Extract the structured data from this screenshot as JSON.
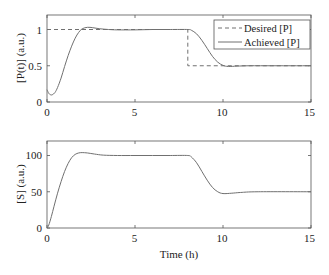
{
  "chart_data": [
    {
      "type": "line",
      "title": "",
      "xlabel": "",
      "ylabel": "[P(t)] (a.u.)",
      "xlim": [
        0,
        15
      ],
      "ylim": [
        0,
        1.2
      ],
      "xticks": [
        0,
        5,
        10,
        15
      ],
      "yticks": [
        0,
        0.5,
        1
      ],
      "ytick_labels": [
        "0",
        "0.5",
        "1"
      ],
      "grid": false,
      "legend_position": "upper right",
      "series": [
        {
          "name": "Desired [P]",
          "style": "dashed",
          "color": "#707070",
          "x": [
            0,
            8,
            8,
            15
          ],
          "y": [
            1,
            1,
            0.5,
            0.5
          ]
        },
        {
          "name": "Achieved [P]",
          "style": "solid",
          "color": "#707070",
          "x": [
            0,
            0.1,
            0.2,
            0.3,
            0.45,
            0.6,
            0.8,
            1.0,
            1.2,
            1.4,
            1.6,
            1.8,
            2.0,
            2.3,
            2.6,
            3.0,
            3.5,
            4.0,
            5.0,
            6.0,
            7.0,
            8.0,
            8.2,
            8.5,
            8.8,
            9.1,
            9.4,
            9.7,
            10.0,
            10.3,
            10.8,
            11.5,
            12.5,
            15.0
          ],
          "y": [
            0.17,
            0.12,
            0.1,
            0.1,
            0.13,
            0.2,
            0.33,
            0.49,
            0.64,
            0.77,
            0.88,
            0.96,
            1.01,
            1.03,
            1.025,
            1.01,
            1.0,
            0.995,
            0.995,
            1.0,
            1.0,
            1.0,
            0.99,
            0.94,
            0.85,
            0.74,
            0.63,
            0.55,
            0.505,
            0.49,
            0.495,
            0.5,
            0.5,
            0.5
          ]
        }
      ],
      "legend": [
        "Desired [P]",
        "Achieved [P]"
      ]
    },
    {
      "type": "line",
      "title": "",
      "xlabel": "Time (h)",
      "ylabel": "[S] (a.u.)",
      "xlim": [
        0,
        15
      ],
      "ylim": [
        0,
        120
      ],
      "xticks": [
        0,
        5,
        10,
        15
      ],
      "yticks": [
        0,
        50,
        100
      ],
      "ytick_labels": [
        "0",
        "50",
        "100"
      ],
      "grid": false,
      "series": [
        {
          "name": "[S]",
          "style": "solid",
          "color": "#707070",
          "x": [
            0,
            0.1,
            0.25,
            0.4,
            0.6,
            0.8,
            1.0,
            1.2,
            1.4,
            1.6,
            1.8,
            2.0,
            2.3,
            2.7,
            3.2,
            4.0,
            5.0,
            6.0,
            7.0,
            8.0,
            8.2,
            8.5,
            8.8,
            9.1,
            9.4,
            9.7,
            10.0,
            10.5,
            11.0,
            12.0,
            15.0
          ],
          "y": [
            0,
            4,
            16,
            30,
            48,
            64,
            78,
            89,
            97,
            101.5,
            103.5,
            104,
            103.5,
            102,
            100.5,
            100,
            100,
            100,
            100,
            100,
            98,
            90,
            78,
            66,
            56,
            50,
            47.5,
            48,
            49,
            50,
            50
          ]
        }
      ]
    }
  ],
  "plots": {
    "top": {
      "ylabel": "[P(t)] (a.u.)",
      "ytick_labels": [
        "0",
        "0.5",
        "1"
      ],
      "xtick_labels": [
        "0",
        "5",
        "10",
        "15"
      ],
      "legend": {
        "desired_label": "Desired [P]",
        "achieved_label": "Achieved [P]"
      }
    },
    "bottom": {
      "ylabel": "[S] (a.u.)",
      "ytick_labels": [
        "0",
        "50",
        "100"
      ],
      "xtick_labels": [
        "0",
        "5",
        "10",
        "15"
      ],
      "xlabel": "Time (h)"
    }
  },
  "colors": {
    "line": "#707070",
    "axis": "#555555",
    "text": "#222222"
  }
}
